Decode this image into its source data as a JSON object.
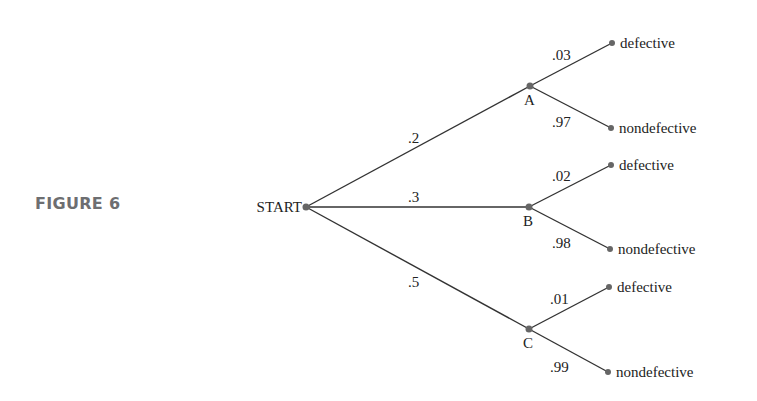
{
  "figure_label": "FIGURE 6",
  "tree": {
    "root": {
      "label": "START",
      "x": 306,
      "y": 207
    },
    "nodes": [
      {
        "id": "A",
        "label": "A",
        "x": 530,
        "y": 86,
        "prob": ".2",
        "prob_x": 408,
        "prob_y": 143,
        "children": [
          {
            "label": "defective",
            "prob": ".03",
            "x": 612,
            "y": 43,
            "prob_x": 552,
            "prob_y": 60
          },
          {
            "label": "nondefective",
            "prob": ".97",
            "x": 611,
            "y": 128,
            "prob_x": 552,
            "prob_y": 127
          }
        ]
      },
      {
        "id": "B",
        "label": "B",
        "x": 529,
        "y": 207,
        "prob": ".3",
        "prob_x": 408,
        "prob_y": 202,
        "children": [
          {
            "label": "defective",
            "prob": ".02",
            "x": 611,
            "y": 165,
            "prob_x": 552,
            "prob_y": 181
          },
          {
            "label": "nondefective",
            "prob": ".98",
            "x": 610,
            "y": 249,
            "prob_x": 552,
            "prob_y": 248
          }
        ]
      },
      {
        "id": "C",
        "label": "C",
        "x": 529,
        "y": 329,
        "prob": ".5",
        "prob_x": 408,
        "prob_y": 287,
        "children": [
          {
            "label": "defective",
            "prob": ".01",
            "x": 609,
            "y": 287,
            "prob_x": 550,
            "prob_y": 304
          },
          {
            "label": "nondefective",
            "prob": ".99",
            "x": 608,
            "y": 372,
            "prob_x": 550,
            "prob_y": 372
          }
        ]
      }
    ]
  }
}
